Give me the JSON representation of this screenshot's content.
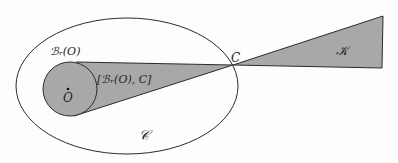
{
  "diagram": {
    "labels": {
      "ball": "ℬᵣ(O)",
      "hull": "[ℬᵣ(O), C]",
      "center": "O",
      "point": "C",
      "cone": "𝒦",
      "convex_set": "𝒞"
    },
    "colors": {
      "fill": "#a8a8a8",
      "stroke": "#2b2b2b",
      "background": "#fdfdfd"
    },
    "shapes": {
      "ellipse": {
        "cx": 127,
        "cy": 86,
        "rx": 111,
        "ry": 68
      },
      "ball": {
        "cx": 70,
        "cy": 89,
        "r": 27
      },
      "point_C": {
        "x": 233,
        "y": 65
      },
      "cone_vertices": [
        [
          233,
          65
        ],
        [
          383,
          16
        ],
        [
          382,
          68
        ]
      ]
    }
  }
}
